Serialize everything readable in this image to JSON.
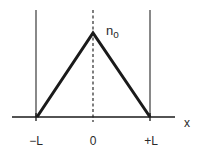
{
  "diagram": {
    "type": "triangular-profile",
    "peak_label": "n",
    "peak_label_subscript": "o",
    "axis_label": "x",
    "tick_labels": [
      "−L",
      "0",
      "+L"
    ],
    "colors": {
      "line": "#1a1a1a",
      "boundary": "#3a3a3a",
      "text": "#2a2a2a",
      "background": "#ffffff"
    }
  }
}
